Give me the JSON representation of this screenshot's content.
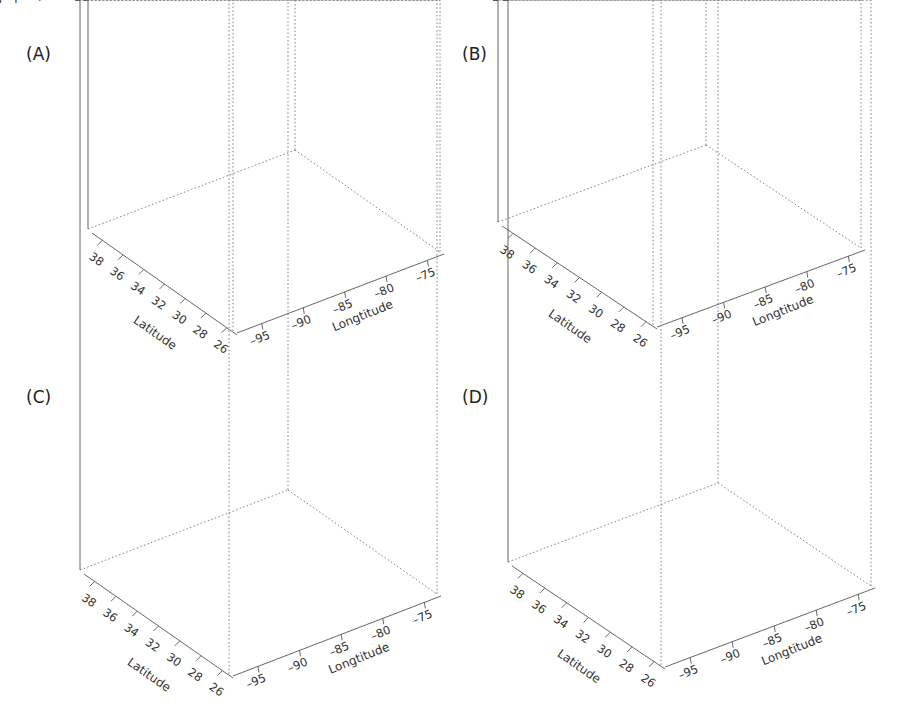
{
  "chart_data": [
    {
      "id": "A",
      "type": "surface3d",
      "panel_label": "(A)",
      "zlabel": "Log (aquatics)",
      "xlabel": "Latitude",
      "ylabel": "Longtitude",
      "z_ticks": [
        "0",
        "0.5",
        "1",
        "1.5",
        "2",
        "2.5",
        "3"
      ],
      "z_values": [
        0,
        0.5,
        1,
        1.5,
        2,
        2.5,
        3
      ],
      "zlim": [
        0,
        3
      ],
      "lat_ticks": [
        "38",
        "36",
        "34",
        "32",
        "30",
        "28",
        "26"
      ],
      "lon_ticks": [
        "-95",
        "-90",
        "-85",
        "-80",
        "-75"
      ],
      "lat_range": [
        26,
        39
      ],
      "lon_range": [
        -98,
        -75
      ],
      "surface_peaks": [
        {
          "lat": 35.5,
          "lon": -93,
          "z": 2.0
        },
        {
          "lat": 34,
          "lon": -91,
          "z": 2.3
        },
        {
          "lat": 33,
          "lon": -89,
          "z": 2.5
        },
        {
          "lat": 31.5,
          "lon": -88,
          "z": 3.0
        },
        {
          "lat": 37,
          "lon": -95,
          "z": 1.0
        },
        {
          "lat": 30,
          "lon": -92,
          "z": 1.8
        },
        {
          "lat": 29,
          "lon": -96,
          "z": 1.1
        },
        {
          "lat": 27.5,
          "lon": -82,
          "z": 1.5
        },
        {
          "lat": 28.5,
          "lon": -83,
          "z": 1.2
        },
        {
          "lat": 28,
          "lon": -78,
          "z": 0.6
        }
      ],
      "description": "Observed log aquatic counts; tall spikes up to ~3 concentrated mid-latitude, secondary cluster in the southeast"
    },
    {
      "id": "B",
      "type": "surface3d",
      "panel_label": "(B)",
      "zlabel": "Trend",
      "xlabel": "Latitude",
      "ylabel": "Longtitude",
      "z_ticks": [
        "0",
        "0.5",
        "1",
        "1.5",
        "2",
        "2.5",
        "3"
      ],
      "z_values": [
        0,
        0.5,
        1,
        1.5,
        2,
        2.5,
        3
      ],
      "zlim": [
        0,
        3
      ],
      "lat_ticks": [
        "38",
        "36",
        "34",
        "32",
        "30",
        "28",
        "26"
      ],
      "lon_ticks": [
        "-95",
        "-90",
        "-85",
        "-80",
        "-75"
      ],
      "lat_range": [
        26,
        39
      ],
      "lon_range": [
        -98,
        -75
      ],
      "surface_peaks": [
        {
          "lat": 35,
          "lon": -93,
          "z": 1.6
        },
        {
          "lat": 33.5,
          "lon": -90,
          "z": 2.0
        },
        {
          "lat": 32,
          "lon": -88,
          "z": 2.4
        },
        {
          "lat": 37,
          "lon": -95,
          "z": 0.8
        },
        {
          "lat": 30,
          "lon": -93,
          "z": 1.1
        },
        {
          "lat": 28,
          "lon": -83,
          "z": 1.2
        },
        {
          "lat": 28,
          "lon": -79,
          "z": 0.5
        }
      ],
      "description": "Smoothed trend component; broad ridge reaching ~2.5"
    },
    {
      "id": "C",
      "type": "surface3d",
      "panel_label": "(C)",
      "zlabel": "Spatial component",
      "xlabel": "Latitude",
      "ylabel": "Longtitude",
      "z_ticks": [
        "-1",
        "0",
        "1",
        "2",
        "3"
      ],
      "z_values": [
        -1,
        0,
        1,
        2,
        3
      ],
      "zlim": [
        -1,
        3
      ],
      "lat_ticks": [
        "38",
        "36",
        "34",
        "32",
        "30",
        "28",
        "26"
      ],
      "lon_ticks": [
        "-95",
        "-90",
        "-85",
        "-80",
        "-75"
      ],
      "lat_range": [
        26,
        39
      ],
      "lon_range": [
        -98,
        -75
      ],
      "surface_peaks": [
        {
          "lat": 36,
          "lon": -94,
          "z": 0.8
        },
        {
          "lat": 34,
          "lon": -90,
          "z": 0.9
        },
        {
          "lat": 32,
          "lon": -87,
          "z": 1.6
        },
        {
          "lat": 31,
          "lon": -88,
          "z": 0.9
        },
        {
          "lat": 30,
          "lon": -94,
          "z": 1.0
        },
        {
          "lat": 28,
          "lon": -82,
          "z": 0.5
        },
        {
          "lat": 37.5,
          "lon": -97,
          "z": 0.5
        }
      ],
      "description": "Spatial component; mostly flat near 0 with small peaks up to ~1.8"
    },
    {
      "id": "D",
      "type": "surface3d",
      "panel_label": "(D)",
      "zlabel": "Random noise",
      "xlabel": "Latitude",
      "ylabel": "Longtitude",
      "z_ticks": [
        "-1",
        "0",
        "1",
        "2",
        "3"
      ],
      "z_values": [
        -1,
        0,
        1,
        2,
        3
      ],
      "zlim": [
        -1,
        3
      ],
      "lat_ticks": [
        "38",
        "36",
        "34",
        "32",
        "30",
        "28",
        "26"
      ],
      "lon_ticks": [
        "-95",
        "-90",
        "-85",
        "-80",
        "-75"
      ],
      "lat_range": [
        26,
        39
      ],
      "lon_range": [
        -98,
        -75
      ],
      "surface_peaks": [
        {
          "lat": 34.5,
          "lon": -92,
          "z": 0.5
        },
        {
          "lat": 32.5,
          "lon": -89,
          "z": 0.6
        },
        {
          "lat": 31.5,
          "lon": -87,
          "z": 0.7
        },
        {
          "lat": 30,
          "lon": -95,
          "z": 0.5
        },
        {
          "lat": 28,
          "lon": -82,
          "z": 0.2
        }
      ],
      "description": "Random noise component; nearly flat around 0 with minor bumps (<1)"
    }
  ],
  "layout": {
    "panels": [
      {
        "id": "A",
        "label_x": 26,
        "label_y": 60,
        "origin": {
          "zx": 88,
          "z0y": 229,
          "ztop": 112
        },
        "front": {
          "x": 233,
          "y": 331
        },
        "right": {
          "x": 440,
          "y": 252
        },
        "back_left": {
          "x": 88,
          "y": 229
        },
        "back_top": {
          "x": 285,
          "y": 60
        }
      },
      {
        "id": "B",
        "label_x": 462,
        "label_y": 60,
        "origin": {
          "zx": 498,
          "z0y": 222,
          "ztop": 100
        },
        "front": {
          "x": 653,
          "y": 325
        },
        "right": {
          "x": 861,
          "y": 248
        },
        "back_left": {
          "x": 498,
          "y": 222
        },
        "back_top": {
          "x": 707,
          "y": 48
        }
      },
      {
        "id": "C",
        "label_x": 26,
        "label_y": 403,
        "origin": {
          "zx": 80,
          "z0y": 540,
          "ztop": 449
        },
        "front": {
          "x": 229,
          "y": 674
        },
        "right": {
          "x": 437,
          "y": 594
        },
        "back_left": {
          "x": 80,
          "y": 570
        },
        "back_top": {
          "x": 281,
          "y": 394
        }
      },
      {
        "id": "D",
        "label_x": 462,
        "label_y": 403,
        "origin": {
          "zx": 508,
          "z0y": 531,
          "ztop": 440
        },
        "front": {
          "x": 661,
          "y": 665
        },
        "right": {
          "x": 871,
          "y": 586
        },
        "back_left": {
          "x": 508,
          "y": 562
        },
        "back_top": {
          "x": 716,
          "y": 386
        }
      }
    ]
  }
}
